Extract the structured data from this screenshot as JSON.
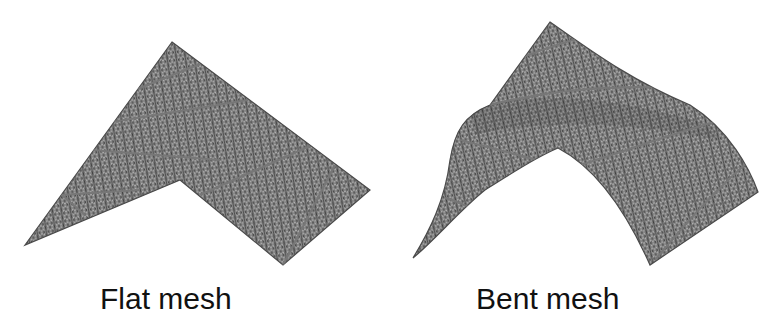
{
  "figure": {
    "panels": [
      {
        "id": "flat",
        "caption": "Flat mesh",
        "mesh_type": "triangular-mesh",
        "shape": "flat"
      },
      {
        "id": "bent",
        "caption": "Bent mesh",
        "mesh_type": "triangular-mesh",
        "shape": "bent"
      }
    ],
    "colors": {
      "background": "#ffffff",
      "mesh_fill": "#9a9a9a",
      "mesh_line": "#3a3a3a",
      "seam_line": "#6e6e6e",
      "caption_text": "#111111"
    }
  }
}
